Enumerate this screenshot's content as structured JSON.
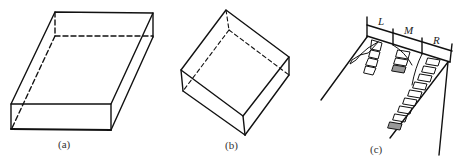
{
  "figure": {
    "panels": [
      {
        "id": "a",
        "caption": "(a)",
        "description": "flat rectangular slab in oblique projection with dashed hidden edges"
      },
      {
        "id": "b",
        "caption": "(b)",
        "description": "rotated square slab with dashed hidden edges"
      },
      {
        "id": "c",
        "caption": "(c)",
        "description": "three hanging chains of segments under a bracket divided into L, M, R",
        "segment_labels": [
          "L",
          "M",
          "R"
        ]
      }
    ]
  }
}
